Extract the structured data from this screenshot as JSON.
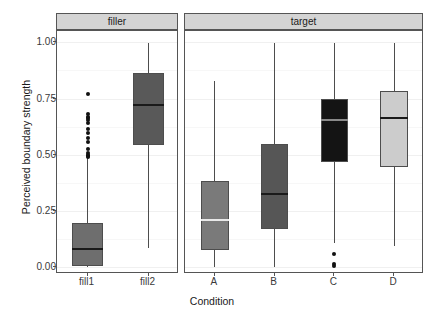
{
  "chart_data": {
    "type": "box",
    "title": "",
    "xlabel": "Condition",
    "ylabel": "Perceived boundary strength",
    "ylim": [
      -0.03,
      1.05
    ],
    "yticks": [
      0.0,
      0.25,
      0.5,
      0.75,
      1.0
    ],
    "ytick_labels": [
      "0.00",
      "0.25",
      "0.50",
      "0.75",
      "1.00"
    ],
    "grid": true,
    "grid_minor": true,
    "legend": "none",
    "facets": [
      {
        "label": "filler",
        "categories": [
          "fill1",
          "fill2"
        ],
        "boxes": [
          {
            "category": "fill1",
            "fill": "#6e6e6e",
            "median_color": "#1a1a1a",
            "lower_whisker": 0.0,
            "q1": 0.005,
            "median": 0.08,
            "q3": 0.195,
            "upper_whisker": 0.485,
            "outliers": [
              0.77,
              0.68,
              0.67,
              0.665,
              0.655,
              0.64,
              0.615,
              0.595,
              0.575,
              0.555,
              0.525,
              0.51,
              0.5,
              0.495,
              0.49
            ]
          },
          {
            "category": "fill2",
            "fill": "#595959",
            "median_color": "#1a1a1a",
            "lower_whisker": 0.085,
            "q1": 0.545,
            "median": 0.72,
            "q3": 0.865,
            "upper_whisker": 0.995,
            "outliers": []
          }
        ]
      },
      {
        "label": "target",
        "categories": [
          "A",
          "B",
          "C",
          "D"
        ],
        "boxes": [
          {
            "category": "A",
            "fill": "#7a7a7a",
            "median_color": "#e8e8e8",
            "lower_whisker": 0.0,
            "q1": 0.075,
            "median": 0.21,
            "q3": 0.385,
            "upper_whisker": 0.83,
            "outliers": []
          },
          {
            "category": "B",
            "fill": "#565656",
            "median_color": "#1a1a1a",
            "lower_whisker": 0.0,
            "q1": 0.17,
            "median": 0.325,
            "q3": 0.55,
            "upper_whisker": 0.995,
            "outliers": []
          },
          {
            "category": "C",
            "fill": "#141414",
            "median_color": "#8a8a8a",
            "lower_whisker": 0.11,
            "q1": 0.47,
            "median": 0.655,
            "q3": 0.75,
            "upper_whisker": 0.995,
            "outliers": [
              0.06,
              0.015,
              0.005
            ]
          },
          {
            "category": "D",
            "fill": "#cccccc",
            "median_color": "#1a1a1a",
            "lower_whisker": 0.095,
            "q1": 0.445,
            "median": 0.665,
            "q3": 0.785,
            "upper_whisker": 0.995,
            "outliers": []
          }
        ]
      }
    ]
  },
  "axes": {
    "y_title": "Perceived boundary strength",
    "x_title": "Condition",
    "y_tick_labels": [
      "1.00",
      "0.75",
      "0.50",
      "0.25",
      "0.00"
    ],
    "x_tick_labels": [
      "fill1",
      "fill2",
      "A",
      "B",
      "C",
      "D"
    ]
  },
  "panels": {
    "filler_label": "filler",
    "target_label": "target"
  },
  "colors": {
    "panel_strip": "#d4d4d4",
    "panel_border": "#555555",
    "grid_major": "#f0f0f0",
    "grid_minor": "#f7f7f7",
    "box_stroke": "#4d4d4d",
    "outlier": "#111111"
  }
}
